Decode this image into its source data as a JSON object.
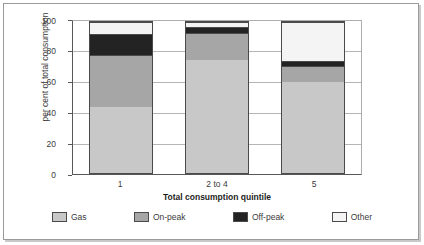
{
  "chart_data": {
    "type": "bar",
    "subtype": "stacked-bar-100",
    "title": "",
    "xlabel": "Total consumption quintile",
    "ylabel": "per cent of total consumption",
    "categories": [
      "1",
      "2 to 4",
      "5"
    ],
    "ylim": [
      0,
      100
    ],
    "yticks": [
      0,
      20,
      40,
      60,
      80,
      100
    ],
    "grid": true,
    "legend_position": "bottom",
    "series": [
      {
        "name": "Gas",
        "color": "#c8c8c8",
        "values": [
          44,
          75,
          60
        ]
      },
      {
        "name": "On-peak",
        "color": "#a6a6a6",
        "values": [
          34,
          18,
          11
        ]
      },
      {
        "name": "Off-peak",
        "color": "#232323",
        "values": [
          14,
          4,
          3
        ]
      },
      {
        "name": "Other",
        "color": "#f4f4f4",
        "values": [
          8,
          3,
          26
        ]
      }
    ],
    "cumulative_tops": [
      [
        44,
        78,
        92,
        100
      ],
      [
        75,
        93,
        97,
        100
      ],
      [
        60,
        71,
        74,
        100
      ]
    ]
  },
  "axes": {
    "y_tick_labels": [
      "100",
      "80",
      "60",
      "40",
      "20",
      "0"
    ],
    "y_title": "per cent of total consumption",
    "x_tick_labels": [
      "1",
      "2 to 4",
      "5"
    ],
    "x_title": "Total consumption quintile"
  },
  "legend": {
    "items": [
      {
        "label": "Gas",
        "color": "#c8c8c8"
      },
      {
        "label": "On-peak",
        "color": "#a6a6a6"
      },
      {
        "label": "Off-peak",
        "color": "#232323"
      },
      {
        "label": "Other",
        "color": "#f4f4f4"
      }
    ]
  }
}
